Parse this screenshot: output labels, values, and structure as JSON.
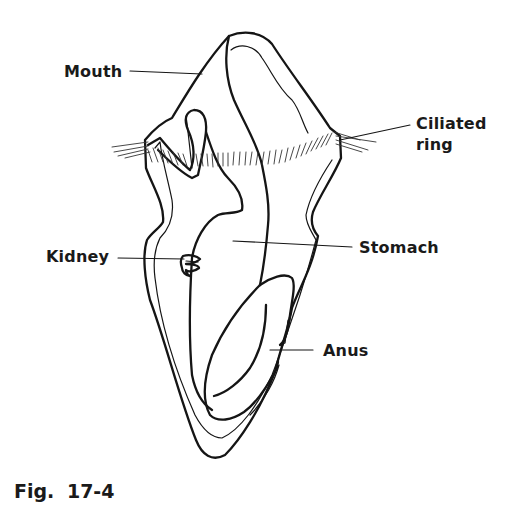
{
  "figure": {
    "caption": "Fig.  17-4",
    "labels": {
      "mouth": "Mouth",
      "ciliated_ring_line1": "Ciliated",
      "ciliated_ring_line2": "ring",
      "kidney": "Kidney",
      "stomach": "Stomach",
      "anus": "Anus"
    },
    "colors": {
      "ink": "#151515",
      "background": "#ffffff"
    }
  }
}
